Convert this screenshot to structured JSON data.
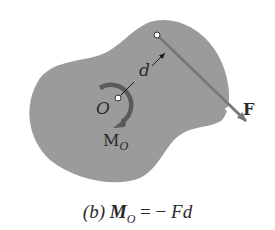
{
  "figure": {
    "colors": {
      "body_fill": "#9b9b9b",
      "force_arrow": "#787878",
      "moment_arrow": "#5a5a5a",
      "point_fill": "#ffffff",
      "text": "#2a2a2a"
    },
    "labels": {
      "force": "F",
      "distance": "d",
      "origin": "O",
      "moment_main": "M",
      "moment_sub": "O"
    },
    "caption": {
      "part": "(b)",
      "moment_main": "M",
      "moment_sub": "O",
      "equals": " = − ",
      "rhs": "Fd"
    }
  }
}
